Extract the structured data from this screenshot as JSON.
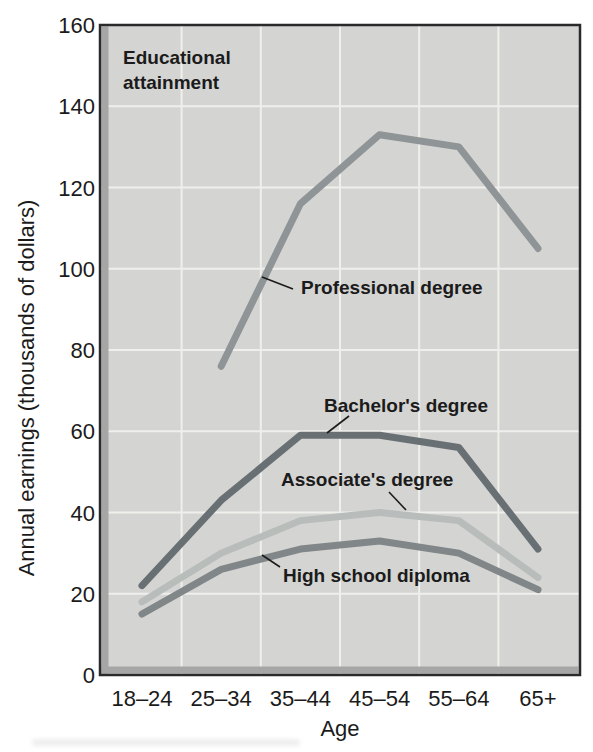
{
  "figure": {
    "inner_title_line1": "Educational",
    "inner_title_line2": "attainment"
  },
  "chart_data": {
    "type": "line",
    "title": "Educational attainment",
    "xlabel": "Age",
    "ylabel": "Annual earnings (thousands of dollars)",
    "categories": [
      "18–24",
      "25–34",
      "35–44",
      "45–54",
      "55–64",
      "65+"
    ],
    "ylim": [
      0,
      160
    ],
    "ytick_step": 20,
    "grid": true,
    "legend_position": "inline-labels",
    "series": [
      {
        "name": "Professional degree",
        "color": "#8f9496",
        "values": [
          null,
          76,
          116,
          133,
          130,
          105
        ]
      },
      {
        "name": "Bachelor's degree",
        "color": "#697074",
        "values": [
          22,
          43,
          59,
          59,
          56,
          31
        ]
      },
      {
        "name": "Associate's degree",
        "color": "#b8bdbc",
        "values": [
          18,
          30,
          38,
          40,
          38,
          24
        ]
      },
      {
        "name": "High school diploma",
        "color": "#818688",
        "values": [
          15,
          26,
          31,
          33,
          30,
          21
        ]
      }
    ]
  },
  "colors": {
    "plot_background": "#d4d4d3",
    "gridline": "#efefec",
    "border": "#2a2a2a",
    "bevel": "#a6a6a6",
    "text": "#1b1b1b"
  }
}
